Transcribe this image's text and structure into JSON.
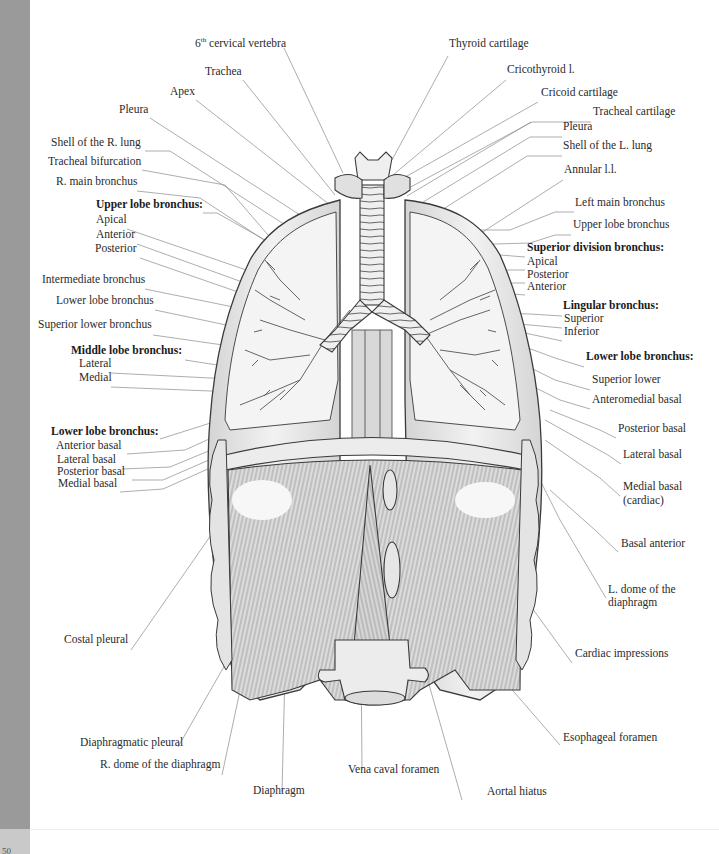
{
  "figure": {
    "page_number": "50"
  },
  "labels_left": [
    {
      "id": "cervical",
      "text": "6th cervical vertebra",
      "x": 195,
      "y": 44,
      "bold": false
    },
    {
      "id": "trachea",
      "text": "Trachea",
      "x": 205,
      "y": 75,
      "bold": false
    },
    {
      "id": "apex",
      "text": "Apex",
      "x": 170,
      "y": 95,
      "bold": false
    },
    {
      "id": "pleura-r",
      "text": "Pleura",
      "x": 119,
      "y": 113,
      "bold": false
    },
    {
      "id": "shell-r",
      "text": "Shell of the R. lung",
      "x": 51,
      "y": 146,
      "bold": false
    },
    {
      "id": "tracheal-bif",
      "text": "Tracheal bifurcation",
      "x": 48,
      "y": 165,
      "bold": false
    },
    {
      "id": "r-main-bronchus",
      "text": "R. main bronchus",
      "x": 56,
      "y": 185,
      "bold": false
    },
    {
      "id": "upper-lobe-r",
      "text": "Upper lobe bronchus:",
      "x": 96,
      "y": 208,
      "bold": true
    },
    {
      "id": "apical-r",
      "text": "Apical",
      "x": 96,
      "y": 223,
      "bold": false
    },
    {
      "id": "anterior-r",
      "text": "Anterior",
      "x": 96,
      "y": 238,
      "bold": false
    },
    {
      "id": "posterior-r",
      "text": "Posterior",
      "x": 95,
      "y": 252,
      "bold": false
    },
    {
      "id": "intermediate",
      "text": "Intermediate bronchus",
      "x": 42,
      "y": 283,
      "bold": false
    },
    {
      "id": "lower-lobe-r",
      "text": "Lower lobe bronchus",
      "x": 56,
      "y": 304,
      "bold": false
    },
    {
      "id": "superior-lower-r",
      "text": "Superior lower bronchus",
      "x": 38,
      "y": 328,
      "bold": false
    },
    {
      "id": "middle-lobe",
      "text": "Middle lobe bronchus:",
      "x": 71,
      "y": 354,
      "bold": true
    },
    {
      "id": "lateral-m",
      "text": "Lateral",
      "x": 79,
      "y": 367,
      "bold": false
    },
    {
      "id": "medial-m",
      "text": "Medial",
      "x": 79,
      "y": 381,
      "bold": false
    },
    {
      "id": "lower-lobe-r2",
      "text": "Lower lobe bronchus:",
      "x": 51,
      "y": 435,
      "bold": true
    },
    {
      "id": "anterior-basal-r",
      "text": "Anterior basal",
      "x": 56,
      "y": 449,
      "bold": false
    },
    {
      "id": "lateral-basal-r",
      "text": "Lateral basal",
      "x": 57,
      "y": 463,
      "bold": false
    },
    {
      "id": "posterior-basal-r",
      "text": "Posterior basal",
      "x": 57,
      "y": 475,
      "bold": false
    },
    {
      "id": "medial-basal-r",
      "text": "Medial basal",
      "x": 58,
      "y": 487,
      "bold": false
    },
    {
      "id": "costal-pleural",
      "text": "Costal pleural",
      "x": 64,
      "y": 643,
      "bold": false
    },
    {
      "id": "diaphragmatic-pleural",
      "text": "Diaphragmatic pleural",
      "x": 80,
      "y": 746,
      "bold": false
    },
    {
      "id": "r-dome",
      "text": "R. dome of the diaphragm",
      "x": 100,
      "y": 768,
      "bold": false
    },
    {
      "id": "diaphragm",
      "text": "Diaphragm",
      "x": 253,
      "y": 794,
      "bold": false
    }
  ],
  "labels_right": [
    {
      "id": "thyroid",
      "text": "Thyroid cartilage",
      "x": 449,
      "y": 47,
      "bold": false
    },
    {
      "id": "cricothyroid",
      "text": "Cricothyroid l.",
      "x": 507,
      "y": 73,
      "bold": false
    },
    {
      "id": "cricoid",
      "text": "Cricoid cartilage",
      "x": 541,
      "y": 96,
      "bold": false
    },
    {
      "id": "tracheal-cart",
      "text": "Tracheal cartilage",
      "x": 593,
      "y": 115,
      "bold": false
    },
    {
      "id": "pleura-l",
      "text": "Pleura",
      "x": 563,
      "y": 130,
      "bold": false
    },
    {
      "id": "shell-l",
      "text": "Shell of the L. lung",
      "x": 563,
      "y": 149,
      "bold": false
    },
    {
      "id": "annular",
      "text": "Annular l.l.",
      "x": 564,
      "y": 173,
      "bold": false
    },
    {
      "id": "left-main",
      "text": "Left main bronchus",
      "x": 575,
      "y": 206,
      "bold": false
    },
    {
      "id": "upper-lobe-l",
      "text": "Upper lobe bronchus",
      "x": 573,
      "y": 228,
      "bold": false
    },
    {
      "id": "superior-division",
      "text": "Superior division bronchus:",
      "x": 527,
      "y": 251,
      "bold": true
    },
    {
      "id": "apical-l",
      "text": "Apical",
      "x": 527,
      "y": 265,
      "bold": false
    },
    {
      "id": "posterior-l",
      "text": "Posterior",
      "x": 527,
      "y": 278,
      "bold": false
    },
    {
      "id": "anterior-l",
      "text": "Anterior",
      "x": 527,
      "y": 290,
      "bold": false
    },
    {
      "id": "lingular",
      "text": "Lingular bronchus:",
      "x": 563,
      "y": 309,
      "bold": true
    },
    {
      "id": "superior-ling",
      "text": "Superior",
      "x": 564,
      "y": 322,
      "bold": false
    },
    {
      "id": "inferior-ling",
      "text": "Inferior",
      "x": 564,
      "y": 335,
      "bold": false
    },
    {
      "id": "lower-lobe-l",
      "text": "Lower lobe bronchus:",
      "x": 586,
      "y": 360,
      "bold": true
    },
    {
      "id": "superior-lower-l",
      "text": "Superior lower",
      "x": 592,
      "y": 383,
      "bold": false
    },
    {
      "id": "anteromedial",
      "text": "Anteromedial basal",
      "x": 592,
      "y": 403,
      "bold": false
    },
    {
      "id": "posterior-basal-l",
      "text": "Posterior basal",
      "x": 618,
      "y": 432,
      "bold": false
    },
    {
      "id": "lateral-basal-l",
      "text": "Lateral basal",
      "x": 623,
      "y": 458,
      "bold": false
    },
    {
      "id": "medial-basal-l",
      "text": "Medial basal",
      "x": 623,
      "y": 490,
      "bold": false
    },
    {
      "id": "cardiac",
      "text": "(cardiac)",
      "x": 623,
      "y": 504,
      "bold": false
    },
    {
      "id": "basal-anterior",
      "text": "Basal anterior",
      "x": 621,
      "y": 547,
      "bold": false
    },
    {
      "id": "l-dome-1",
      "text": "L. dome of the",
      "x": 608,
      "y": 593,
      "bold": false
    },
    {
      "id": "l-dome-2",
      "text": "diaphragm",
      "x": 608,
      "y": 606,
      "bold": false
    },
    {
      "id": "cardiac-impr",
      "text": "Cardiac impressions",
      "x": 575,
      "y": 657,
      "bold": false
    },
    {
      "id": "esophageal",
      "text": "Esophageal foramen",
      "x": 563,
      "y": 741,
      "bold": false
    },
    {
      "id": "vena-caval",
      "text": "Vena caval foramen",
      "x": 348,
      "y": 773,
      "bold": false
    },
    {
      "id": "aortal",
      "text": "Aortal hiatus",
      "x": 487,
      "y": 795,
      "bold": false
    }
  ],
  "colors": {
    "side_strip": "#9a9a9a",
    "side_foot": "#c9c9c9",
    "leader_line": "#7a7a7a",
    "outline": "#3a3a3a",
    "tissue_fill": "#e9e9e9",
    "shading": "#c8c8c8"
  }
}
